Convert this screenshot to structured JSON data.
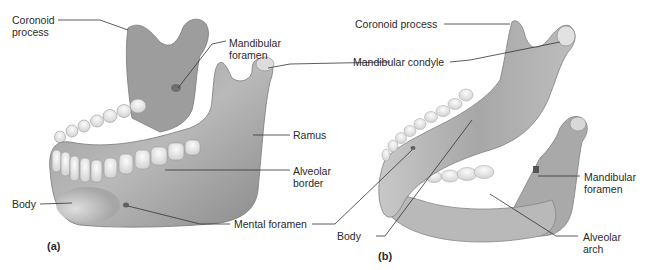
{
  "figure": {
    "panels": [
      {
        "id": "a",
        "tag": "(a)",
        "labels": {
          "coronoid_process": "Coronoid\nprocess",
          "coronoid_process_l1": "Coronoid",
          "coronoid_process_l2": "process",
          "mandibular_foramen_l1": "Mandibular",
          "mandibular_foramen_l2": "foramen",
          "ramus": "Ramus",
          "alveolar_border_l1": "Alveolar",
          "alveolar_border_l2": "border",
          "body": "Body"
        }
      },
      {
        "id": "b",
        "tag": "(b)",
        "labels": {
          "coronoid_process": "Coronoid process",
          "mandibular_condyle": "Mandibular condyle",
          "mandibular_foramen_l1": "Mandibular",
          "mandibular_foramen_l2": "foramen",
          "alveolar_arch_l1": "Alveolar",
          "alveolar_arch_l2": "arch",
          "body": "Body"
        }
      }
    ],
    "shared_labels": {
      "mental_foramen": "Mental foramen",
      "mandibular_condyle": "Mandibular condyle"
    },
    "colors": {
      "bone_dark": "#8f8f8f",
      "bone_mid": "#b5b5b5",
      "bone_light": "#dcdcdc",
      "tooth": "#f2f2f2",
      "leader": "#333333",
      "background": "#ffffff"
    }
  }
}
